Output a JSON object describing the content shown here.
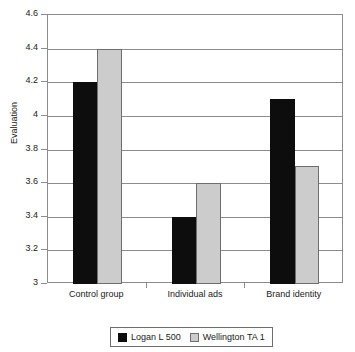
{
  "chart_data": {
    "type": "bar",
    "title": "",
    "subtitle": "",
    "xlabel": "",
    "ylabel": "Evaluation",
    "categories": [
      "Control group",
      "Individual ads",
      "Brand identity"
    ],
    "series": [
      {
        "name": "Logan L 500",
        "color": "#0d0d0d",
        "values": [
          4.2,
          3.4,
          4.1
        ]
      },
      {
        "name": "Wellington TA 1",
        "color": "#cccccc",
        "values": [
          4.4,
          3.6,
          3.7
        ]
      }
    ],
    "ylim": [
      3,
      4.6
    ],
    "ytick_labels": [
      "3",
      "3.2",
      "3.4",
      "3.6",
      "3.8",
      "4",
      "4.2",
      "4.4",
      "4.6"
    ],
    "ytick_values": [
      3,
      3.2,
      3.4,
      3.6,
      3.8,
      4,
      4.2,
      4.4,
      4.6
    ],
    "grid": "horizontal",
    "legend_position": "bottom",
    "legend_entries": [
      "Logan L 500",
      "Wellington TA 1"
    ]
  }
}
